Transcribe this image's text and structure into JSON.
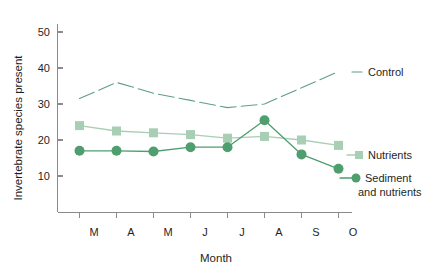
{
  "chart_data": {
    "type": "line",
    "title": "",
    "xlabel": "Month",
    "ylabel": "Invertebrate species present",
    "categories": [
      "M",
      "A",
      "M",
      "J",
      "J",
      "A",
      "S",
      "O"
    ],
    "xlim": [
      0,
      9
    ],
    "ylim": [
      0,
      53
    ],
    "yticks": [
      10,
      20,
      30,
      40,
      50
    ],
    "xticks": [
      "M",
      "A",
      "M",
      "J",
      "J",
      "A",
      "S",
      "O"
    ],
    "grid": false,
    "legend_position": "right-inline",
    "series": [
      {
        "name": "Control",
        "color": "#5f9e86",
        "style": "dashed",
        "marker": "none",
        "values": [
          31.5,
          36,
          33,
          31,
          29,
          30,
          34.5,
          39
        ]
      },
      {
        "name": "Nutrients",
        "color": "#a8ceb4",
        "style": "solid",
        "marker": "square",
        "values": [
          24,
          22.5,
          22,
          21.5,
          20.5,
          21,
          20,
          18.5
        ]
      },
      {
        "name": "Sediment and nutrients",
        "color": "#4e9e6f",
        "style": "solid",
        "marker": "circle",
        "values": [
          17,
          17,
          16.8,
          18,
          18,
          25.5,
          16,
          12
        ]
      }
    ]
  },
  "axes": {
    "y_title": "Invertebrate species present",
    "x_title": "Month",
    "y_tick_labels": [
      "50",
      "40",
      "30",
      "20",
      "10"
    ],
    "x_tick_labels": [
      "M",
      "A",
      "M",
      "J",
      "J",
      "A",
      "S",
      "O"
    ]
  },
  "legend": {
    "control": "Control",
    "nutrients": "Nutrients",
    "sediment_line1": "Sediment",
    "sediment_line2": "and nutrients"
  },
  "colors": {
    "control": "#5f9e86",
    "nutrients": "#a8ceb4",
    "sediment": "#4e9e6f",
    "axis": "#8a8a8a",
    "text": "#1f1f1f",
    "background": "#ffffff"
  }
}
